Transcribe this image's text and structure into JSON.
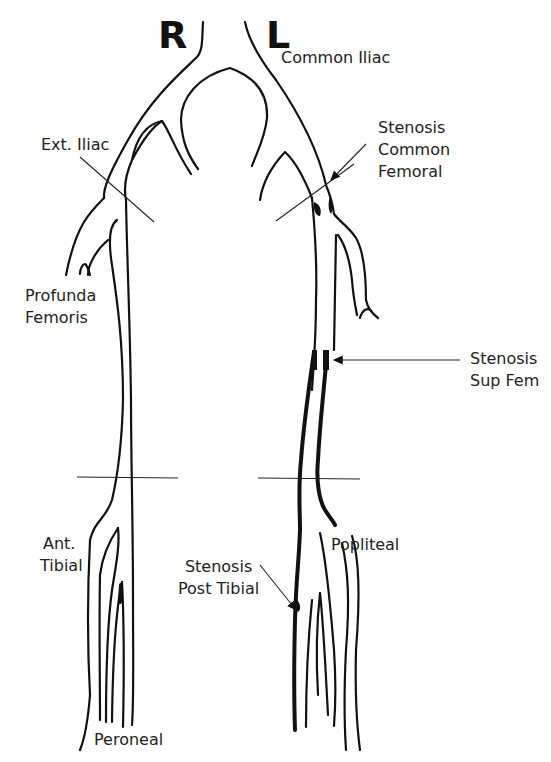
{
  "diagram": {
    "side_labels": {
      "right": "R",
      "left": "L"
    },
    "vessels": {
      "common_iliac": "Common Iliac",
      "ext_iliac": "Ext. Iliac",
      "profunda_line1": "Profunda",
      "profunda_line2": "Femoris",
      "ant_tibial_line1": "Ant.",
      "ant_tibial_line2": "Tibial",
      "peroneal": "Peroneal",
      "popliteal": "Popliteal"
    },
    "stenoses": {
      "common_femoral_line1": "Stenosis",
      "common_femoral_line2": "Common",
      "common_femoral_line3": "Femoral",
      "sup_fem_line1": "Stenosis",
      "sup_fem_line2": "Sup Fem",
      "post_tibial_line1": "Stenosis",
      "post_tibial_line2": "Post Tibial"
    },
    "colors": {
      "line": "#111111",
      "background": "#ffffff",
      "text": "#222222"
    }
  }
}
